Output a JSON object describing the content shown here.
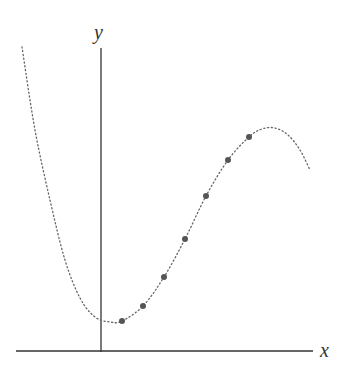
{
  "chart_data": {
    "type": "scatter",
    "title": "",
    "xlabel": "x",
    "ylabel": "y",
    "grid": false,
    "legend": null,
    "axes": {
      "ticks": "none",
      "y_axis_pixel_x": 101,
      "x_axis_pixel_y": 351
    },
    "series": [
      {
        "name": "data points",
        "style": "filled-circle",
        "color": "#555555",
        "pixel_points": [
          [
            122,
            321
          ],
          [
            143,
            306
          ],
          [
            164,
            277
          ],
          [
            185,
            239
          ],
          [
            206,
            196
          ],
          [
            228,
            160
          ],
          [
            249,
            137
          ]
        ]
      },
      {
        "name": "fitted curve",
        "style": "dotted-line",
        "color": "#666666",
        "description": "cubic-like curve: descends steeply from upper-left, minimum near y-axis, rises through points, peaks then falls",
        "pixel_path": [
          [
            22,
            47
          ],
          [
            35,
            130
          ],
          [
            50,
            200
          ],
          [
            65,
            260
          ],
          [
            80,
            298
          ],
          [
            95,
            317
          ],
          [
            110,
            322
          ],
          [
            122,
            321
          ],
          [
            143,
            306
          ],
          [
            164,
            277
          ],
          [
            185,
            239
          ],
          [
            206,
            196
          ],
          [
            228,
            160
          ],
          [
            249,
            137
          ],
          [
            262,
            129
          ],
          [
            275,
            128
          ],
          [
            288,
            135
          ],
          [
            300,
            150
          ],
          [
            310,
            170
          ]
        ]
      }
    ]
  },
  "labels": {
    "x": "x",
    "y": "y"
  }
}
